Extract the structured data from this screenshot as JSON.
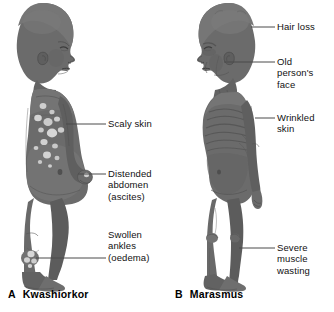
{
  "figure": {
    "type": "medical-illustration",
    "background_color": "#ffffff",
    "figure_fill_color": "#6b6b6b",
    "figure_shadow_color": "#4f4f4f",
    "patch_color": "#cfcfcf",
    "leader_line_color": "#4a4a4a",
    "text_color": "#111111"
  },
  "panels": [
    {
      "id": "kwashiorkor",
      "caption_letter": "A",
      "caption_text": "Kwashiorkor",
      "figure_orientation": "profile-facing-right",
      "labels": [
        {
          "id": "scaly-skin",
          "text": "Scaly skin",
          "target": "upper arm / flank"
        },
        {
          "id": "distended-abdomen",
          "text": "Distended\nabdomen\n(ascites)",
          "target": "belly"
        },
        {
          "id": "swollen-ankles",
          "text": "Swollen\nankles\n(oedema)",
          "target": "ankle"
        }
      ]
    },
    {
      "id": "marasmus",
      "caption_letter": "B",
      "caption_text": "Marasmus",
      "figure_orientation": "profile-facing-left",
      "labels": [
        {
          "id": "hair-loss",
          "text": "Hair loss",
          "target": "scalp"
        },
        {
          "id": "old-persons-face",
          "text": "Old\nperson's\nface",
          "target": "face"
        },
        {
          "id": "wrinkled-skin",
          "text": "Wrinkled\nskin",
          "target": "torso / ribs"
        },
        {
          "id": "severe-muscle-wasting",
          "text": "Severe\nmuscle\nwasting",
          "target": "lower leg"
        }
      ]
    }
  ]
}
